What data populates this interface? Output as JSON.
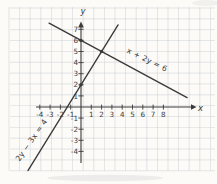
{
  "chart_data": {
    "type": "line",
    "title": "",
    "xlabel": "x",
    "ylabel": "y",
    "xlim": [
      -4.7,
      10.6
    ],
    "ylim": [
      -5.3,
      7.6
    ],
    "grid": true,
    "x_ticks": [
      -4,
      -3,
      -2,
      -1,
      1,
      2,
      3,
      4,
      5,
      6,
      7,
      8
    ],
    "y_ticks": [
      -4,
      -3,
      -2,
      -1,
      1,
      2,
      3,
      4,
      5,
      6,
      7
    ],
    "series": [
      {
        "name": "x + 2y = 6",
        "slope_drawn": -0.5,
        "y_intercept_drawn": 6,
        "x_range": [
          -3.1,
          10.3
        ],
        "points": [
          [
            0,
            6
          ],
          [
            2,
            5
          ]
        ]
      },
      {
        "name": "2y − 3x = 4",
        "slope_drawn": 1.5,
        "y_intercept_drawn": 2,
        "x_range": [
          -5.15,
          3.6
        ],
        "points": [
          [
            0,
            2
          ],
          [
            2,
            5
          ]
        ]
      }
    ],
    "marked_points": [
      [
        0,
        6
      ],
      [
        0,
        2
      ],
      [
        2,
        5
      ]
    ],
    "intersection": [
      2,
      5
    ],
    "colors": {
      "paper": "#fcfbf8",
      "grid": "#ccd0d6",
      "ink": "#3a3a3a"
    }
  }
}
